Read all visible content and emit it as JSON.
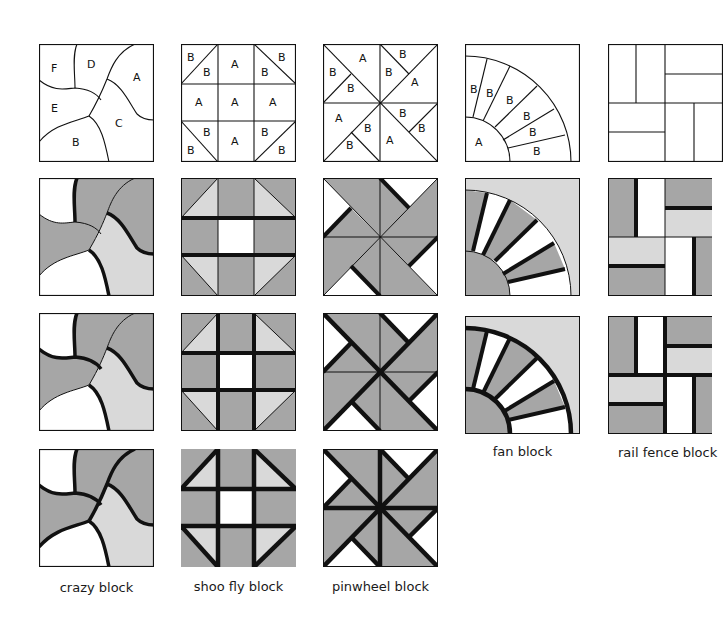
{
  "figure": {
    "colors": {
      "dark_fabric": "#a6a6a6",
      "light_fabric": "#d9d9d9",
      "white_fabric": "#ffffff",
      "line": "#111111"
    },
    "captions": {
      "crazy": "crazy block",
      "shoofly": "shoo fly block",
      "pinwheel": "pinwheel block",
      "fan": "fan block",
      "railfence": "rail fence block"
    },
    "piece_labels": {
      "crazy": [
        "F",
        "D",
        "A",
        "E",
        "C",
        "B"
      ],
      "shoofly": [
        "B",
        "B",
        "A",
        "B",
        "B",
        "A",
        "A",
        "A",
        "B",
        "B",
        "A",
        "B",
        "B"
      ],
      "pinwheel": [
        "B",
        "A",
        "B",
        "B",
        "B",
        "B",
        "A",
        "A",
        "B",
        "B",
        "B",
        "A",
        "B",
        "B"
      ],
      "fan": [
        "B",
        "B",
        "B",
        "B",
        "B",
        "B",
        "A"
      ]
    },
    "rows": [
      "template (labeled pieces)",
      "colored, seams 1",
      "colored, seams 2",
      "colored, seams 3"
    ]
  }
}
